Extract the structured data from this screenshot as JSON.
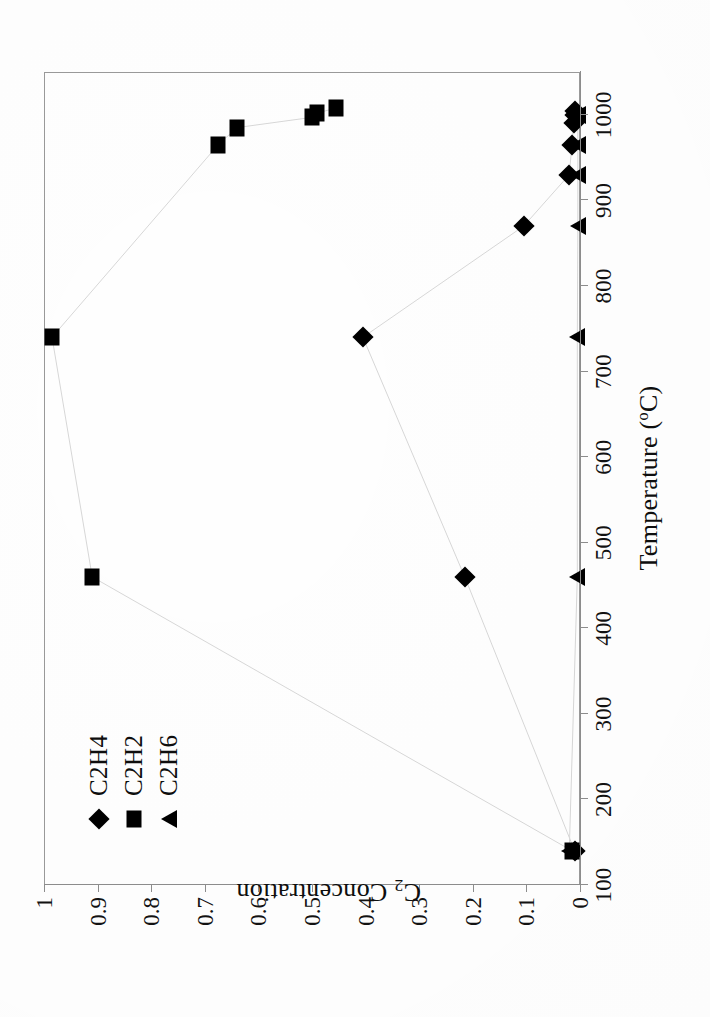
{
  "chart_data": {
    "type": "scatter",
    "title": "",
    "xlabel": "Temperature (°C)",
    "ylabel": "C2 Concentration",
    "ylabel_base": "C",
    "ylabel_sub": "2",
    "ylabel_rest": " Concentration",
    "xlabel_base": "Temperature (",
    "xlabel_sup": "o",
    "xlabel_rest": "C)",
    "xlim": [
      100,
      1050
    ],
    "ylim": [
      0,
      1
    ],
    "grid": false,
    "legend_position": "upper-left-inside",
    "x_ticks": [
      100,
      200,
      300,
      400,
      500,
      600,
      700,
      800,
      900,
      1000
    ],
    "x_tick_labels": [
      "100",
      "200",
      "300",
      "400",
      "500",
      "600",
      "700",
      "800",
      "900",
      "1000"
    ],
    "y_ticks": [
      0,
      0.1,
      0.2,
      0.3,
      0.4,
      0.5,
      0.6,
      0.7,
      0.8,
      0.9,
      1
    ],
    "y_tick_labels": [
      "0",
      "0.1",
      "0.2",
      "0.3",
      "0.4",
      "0.5",
      "0.6",
      "0.7",
      "0.8",
      "0.9",
      "1"
    ],
    "series": [
      {
        "name": "C2H4",
        "marker": "diamond",
        "x": [
          140,
          460,
          740,
          870,
          930,
          965,
          990,
          1000,
          1005
        ],
        "y": [
          0.01,
          0.215,
          0.405,
          0.105,
          0.02,
          0.015,
          0.012,
          0.01,
          0.01
        ]
      },
      {
        "name": "C2H2",
        "marker": "square",
        "x": [
          140,
          460,
          740,
          965,
          985,
          997,
          1002,
          1008
        ],
        "y": [
          0.015,
          0.91,
          0.985,
          0.675,
          0.64,
          0.5,
          0.49,
          0.455
        ]
      },
      {
        "name": "C2H6",
        "marker": "triangle",
        "x": [
          140,
          460,
          740,
          870,
          930,
          965,
          1000
        ],
        "y": [
          0.02,
          0.005,
          0.005,
          0.004,
          0.004,
          0.004,
          0.004
        ]
      }
    ]
  },
  "legend": {
    "items": [
      {
        "label": "C2H4",
        "marker": "diamond"
      },
      {
        "label": "C2H2",
        "marker": "square"
      },
      {
        "label": "C2H6",
        "marker": "triangle"
      }
    ]
  },
  "colors": {
    "marker": "#000000",
    "axis": "#8d8d8d",
    "frame": "#9a9a9a",
    "text": "#111111",
    "background": "#ffffff"
  }
}
